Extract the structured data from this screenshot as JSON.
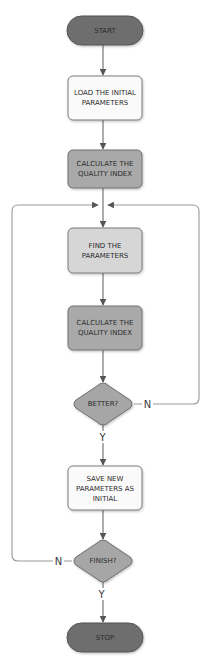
{
  "diagram": {
    "type": "flowchart",
    "colors": {
      "terminal_fill": "#6e6e6e",
      "terminal_stroke": "#555555",
      "process_white_fill": "#fafafa",
      "process_light_fill": "#d6d6d6",
      "process_mid_fill": "#a9a9a9",
      "decision_fill": "#a6a6a6",
      "node_stroke": "#7a7a7a",
      "edge_stroke": "#6a6a6a"
    },
    "nodes": [
      {
        "id": "start",
        "shape": "terminal",
        "lines": [
          "START"
        ]
      },
      {
        "id": "load",
        "shape": "process",
        "lines": [
          "LOAD THE INITIAL",
          "PARAMETERS"
        ]
      },
      {
        "id": "calc1",
        "shape": "process",
        "lines": [
          "CALCULATE THE",
          "QUALITY INDEX"
        ]
      },
      {
        "id": "find",
        "shape": "process",
        "lines": [
          "FIND THE",
          "PARAMETERS"
        ]
      },
      {
        "id": "calc2",
        "shape": "process",
        "lines": [
          "CALCULATE THE",
          "QUALITY INDEX"
        ]
      },
      {
        "id": "better",
        "shape": "decision",
        "lines": [
          "BETTER?"
        ]
      },
      {
        "id": "save",
        "shape": "process",
        "lines": [
          "SAVE NEW",
          "PARAMETERS AS",
          "INITIAL"
        ]
      },
      {
        "id": "finish",
        "shape": "decision",
        "lines": [
          "FINISH?"
        ]
      },
      {
        "id": "stop",
        "shape": "terminal",
        "lines": [
          "STOP"
        ]
      }
    ],
    "edges": [
      {
        "from": "start",
        "to": "load",
        "label": ""
      },
      {
        "from": "load",
        "to": "calc1",
        "label": ""
      },
      {
        "from": "calc1",
        "to": "find",
        "label": ""
      },
      {
        "from": "find",
        "to": "calc2",
        "label": ""
      },
      {
        "from": "calc2",
        "to": "better",
        "label": ""
      },
      {
        "from": "better",
        "to": "save",
        "label": "Y"
      },
      {
        "from": "better",
        "to": "find",
        "label": "N"
      },
      {
        "from": "save",
        "to": "finish",
        "label": ""
      },
      {
        "from": "finish",
        "to": "stop",
        "label": "Y"
      },
      {
        "from": "finish",
        "to": "find",
        "label": "N"
      }
    ],
    "labels": {
      "start": "START",
      "load_1": "LOAD THE INITIAL",
      "load_2": "PARAMETERS",
      "calc1_1": "CALCULATE THE",
      "calc1_2": "QUALITY INDEX",
      "find_1": "FIND THE",
      "find_2": "PARAMETERS",
      "calc2_1": "CALCULATE THE",
      "calc2_2": "QUALITY INDEX",
      "better": "BETTER?",
      "better_no": "N",
      "better_yes": "Y",
      "save_1": "SAVE NEW",
      "save_2": "PARAMETERS AS",
      "save_3": "INITIAL",
      "finish": "FINISH?",
      "finish_no": "N",
      "finish_yes": "Y",
      "stop": "STOP"
    }
  }
}
